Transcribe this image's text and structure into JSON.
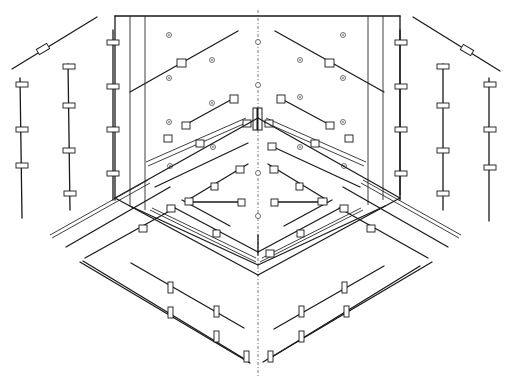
{
  "figure": {
    "type": "isometric technical line drawing",
    "colors": {
      "line": "#1a1a1a",
      "background": "#ffffff",
      "axis": "#555555"
    },
    "center_axis": {
      "x": 258,
      "y_start": 10,
      "y_end": 375,
      "style": "dash-dot"
    },
    "back_panel": {
      "top": 16,
      "left": 115,
      "right": 400,
      "floor_corner_y": 240
    },
    "groups": [
      {
        "name": "left-outer-rails",
        "count": 3
      },
      {
        "name": "right-outer-rails",
        "count": 3
      },
      {
        "name": "back-wall-rails",
        "count": 8
      },
      {
        "name": "floor-frame-rails",
        "count": 8
      },
      {
        "name": "front-lower-rails",
        "count": 6
      }
    ]
  }
}
